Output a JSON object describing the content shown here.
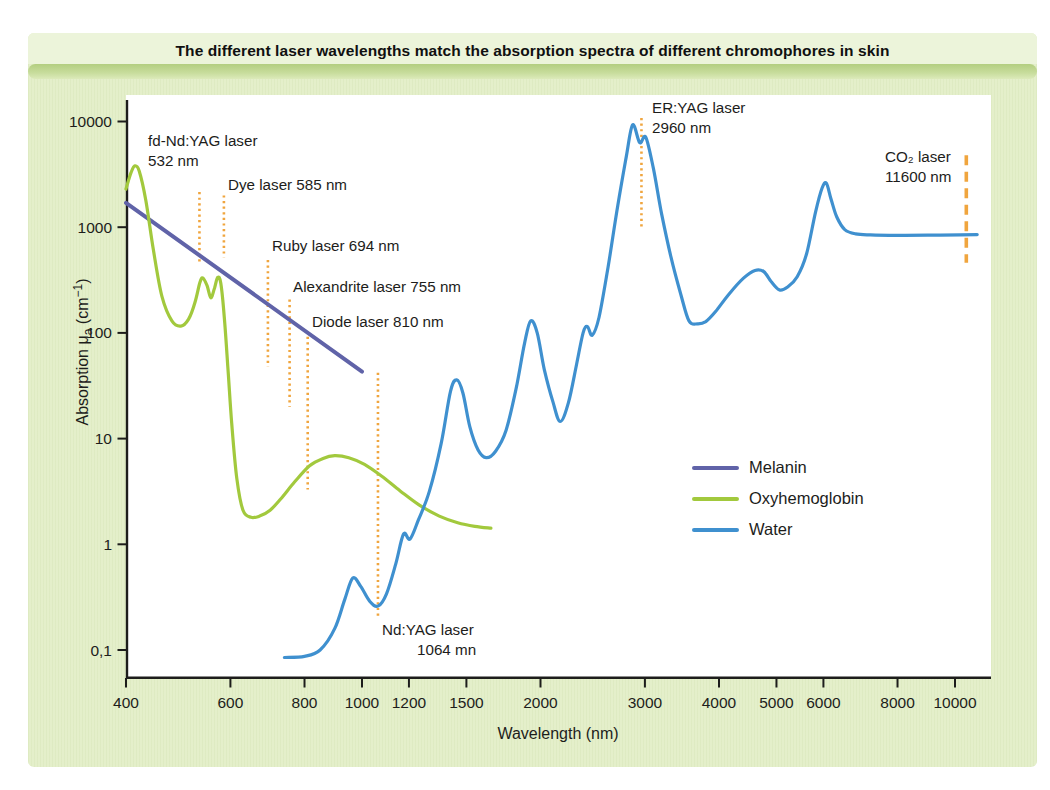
{
  "figure": {
    "title": "The different laser wavelengths match the absorption spectra of different chromophores in skin"
  },
  "chart_data": {
    "type": "line",
    "title": "The different laser wavelengths match the absorption spectra of different chromophores in skin",
    "xlabel": "Wavelength (nm)",
    "ylabel": "Absorption μa (cm−1)",
    "ylabel_parts": {
      "pre": "Absorption μ",
      "sub": "a",
      "mid": " (cm",
      "sup": "−1",
      "post": ")"
    },
    "x_scale": "log",
    "y_scale": "log",
    "xlim": [
      400,
      11400
    ],
    "ylim": [
      0.05,
      15000
    ],
    "grid": false,
    "axis_color": "#1d1d1b",
    "laser_color": "#f0a53e",
    "x_ticks": [
      400,
      600,
      800,
      1000,
      1200,
      1500,
      2000,
      3000,
      4000,
      5000,
      6000,
      8000,
      10000
    ],
    "y_ticks": [
      {
        "v": 10000,
        "label": "10000"
      },
      {
        "v": 1000,
        "label": "1000"
      },
      {
        "v": 100,
        "label": "100"
      },
      {
        "v": 10,
        "label": "10"
      },
      {
        "v": 1,
        "label": "1"
      },
      {
        "v": 0.1,
        "label": "0,1"
      }
    ],
    "series": [
      {
        "name": "Melanin",
        "color": "#6063a8",
        "width": 4,
        "points": [
          [
            400,
            1700
          ],
          [
            1000,
            43
          ]
        ]
      },
      {
        "name": "Oxyhemoglobin",
        "color": "#a2c93d",
        "width": 3.2,
        "points": [
          [
            400,
            2300
          ],
          [
            408,
            3300
          ],
          [
            414,
            3800
          ],
          [
            421,
            3400
          ],
          [
            432,
            1800
          ],
          [
            445,
            600
          ],
          [
            460,
            220
          ],
          [
            478,
            130
          ],
          [
            495,
            116
          ],
          [
            510,
            135
          ],
          [
            523,
            195
          ],
          [
            533,
            300
          ],
          [
            539,
            330
          ],
          [
            548,
            280
          ],
          [
            556,
            215
          ],
          [
            564,
            265
          ],
          [
            571,
            335
          ],
          [
            578,
            295
          ],
          [
            586,
            140
          ],
          [
            594,
            48
          ],
          [
            603,
            14
          ],
          [
            615,
            4.2
          ],
          [
            630,
            2.1
          ],
          [
            650,
            1.8
          ],
          [
            672,
            1.85
          ],
          [
            700,
            2.1
          ],
          [
            730,
            2.7
          ],
          [
            770,
            3.9
          ],
          [
            815,
            5.5
          ],
          [
            860,
            6.5
          ],
          [
            900,
            6.9
          ],
          [
            950,
            6.6
          ],
          [
            1010,
            5.7
          ],
          [
            1080,
            4.4
          ],
          [
            1160,
            3.2
          ],
          [
            1250,
            2.35
          ],
          [
            1350,
            1.85
          ],
          [
            1450,
            1.6
          ],
          [
            1550,
            1.48
          ],
          [
            1650,
            1.42
          ]
        ]
      },
      {
        "name": "Water",
        "color": "#3f90cf",
        "width": 3.2,
        "points": [
          [
            740,
            0.085
          ],
          [
            800,
            0.087
          ],
          [
            850,
            0.1
          ],
          [
            900,
            0.16
          ],
          [
            935,
            0.3
          ],
          [
            965,
            0.48
          ],
          [
            995,
            0.4
          ],
          [
            1030,
            0.29
          ],
          [
            1064,
            0.26
          ],
          [
            1100,
            0.34
          ],
          [
            1140,
            0.65
          ],
          [
            1175,
            1.25
          ],
          [
            1205,
            1.12
          ],
          [
            1245,
            1.7
          ],
          [
            1300,
            3.2
          ],
          [
            1360,
            9
          ],
          [
            1410,
            28
          ],
          [
            1445,
            36
          ],
          [
            1480,
            27
          ],
          [
            1520,
            13
          ],
          [
            1570,
            7.8
          ],
          [
            1620,
            6.6
          ],
          [
            1680,
            7.6
          ],
          [
            1750,
            12
          ],
          [
            1820,
            30
          ],
          [
            1880,
            80
          ],
          [
            1925,
            130
          ],
          [
            1975,
            100
          ],
          [
            2030,
            45
          ],
          [
            2100,
            22
          ],
          [
            2160,
            14.5
          ],
          [
            2230,
            22
          ],
          [
            2300,
            50
          ],
          [
            2360,
            100
          ],
          [
            2400,
            115
          ],
          [
            2445,
            95
          ],
          [
            2510,
            140
          ],
          [
            2600,
            420
          ],
          [
            2700,
            1600
          ],
          [
            2790,
            4600
          ],
          [
            2860,
            9300
          ],
          [
            2940,
            6300
          ],
          [
            3010,
            7100
          ],
          [
            3100,
            3600
          ],
          [
            3200,
            1350
          ],
          [
            3320,
            520
          ],
          [
            3450,
            230
          ],
          [
            3560,
            130
          ],
          [
            3680,
            122
          ],
          [
            3800,
            128
          ],
          [
            3950,
            160
          ],
          [
            4150,
            230
          ],
          [
            4400,
            330
          ],
          [
            4600,
            390
          ],
          [
            4760,
            380
          ],
          [
            4900,
            305
          ],
          [
            5060,
            255
          ],
          [
            5220,
            272
          ],
          [
            5420,
            340
          ],
          [
            5620,
            560
          ],
          [
            5820,
            1400
          ],
          [
            5970,
            2350
          ],
          [
            6070,
            2600
          ],
          [
            6180,
            1850
          ],
          [
            6320,
            1250
          ],
          [
            6520,
            950
          ],
          [
            6800,
            865
          ],
          [
            7200,
            845
          ],
          [
            8000,
            838
          ],
          [
            9000,
            840
          ],
          [
            10200,
            848
          ],
          [
            10900,
            852
          ]
        ]
      }
    ],
    "lasers": [
      {
        "label_lines": [
          "fd-Nd:YAG laser",
          "532 nm"
        ],
        "nm": 532,
        "line_v": [
          2150,
          470
        ],
        "style": "dotted",
        "label_pos": [
          148,
          131
        ]
      },
      {
        "label_lines": [
          "Dye laser 585 nm"
        ],
        "nm": 585,
        "line_v": [
          2000,
          520
        ],
        "style": "dotted",
        "label_pos": [
          228,
          175
        ]
      },
      {
        "label_lines": [
          "Ruby laser 694 nm"
        ],
        "nm": 694,
        "line_v": [
          490,
          48
        ],
        "style": "dotted",
        "label_pos": [
          272,
          236
        ]
      },
      {
        "label_lines": [
          "Alexandrite laser 755 nm"
        ],
        "nm": 755,
        "line_v": [
          207,
          20
        ],
        "style": "dotted",
        "label_pos": [
          293,
          277
        ]
      },
      {
        "label_lines": [
          "Diode laser 810 nm"
        ],
        "nm": 810,
        "line_v": [
          92,
          3.3
        ],
        "style": "dotted",
        "label_pos": [
          312,
          312
        ]
      },
      {
        "label_lines": [
          "Nd:YAG laser",
          "1064 mn"
        ],
        "nm": 1064,
        "line_v": [
          42,
          0.2
        ],
        "style": "dotted",
        "label_pos": [
          382,
          620
        ],
        "indent2": 35
      },
      {
        "label_lines": [
          "ER:YAG laser",
          "2960 nm"
        ],
        "nm": 2960,
        "line_v": [
          10800,
          1000
        ],
        "style": "dotted",
        "label_pos": [
          652,
          98
        ]
      },
      {
        "label_lines": [
          "CO₂ laser",
          "11600 nm"
        ],
        "nm": 11600,
        "line_nm": 10450,
        "line_v": [
          4800,
          460
        ],
        "style": "dashed",
        "label_pos": [
          885,
          147
        ]
      }
    ],
    "legend": {
      "position": "middle-right",
      "entries": [
        "Melanin",
        "Oxyhemoglobin",
        "Water"
      ]
    }
  }
}
